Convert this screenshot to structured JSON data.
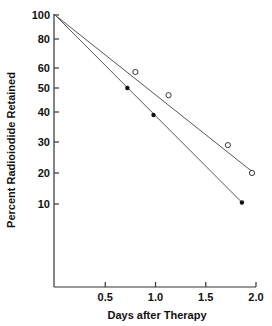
{
  "chart_data": {
    "type": "scatter",
    "title": "",
    "xlabel": "Days after Therapy",
    "ylabel": "Percent Radioiodide Retained",
    "xlim": [
      0,
      2.0
    ],
    "ylim": [
      0,
      100
    ],
    "x_ticks": [
      "0.5",
      "1.0",
      "1.5",
      "2.0"
    ],
    "y_ticks": [
      "100",
      "80",
      "60",
      "50",
      "40",
      "30",
      "20",
      "10"
    ],
    "grid": false,
    "legend": null,
    "series": [
      {
        "name": "open-circles",
        "marker": "open-circle",
        "x": [
          0.8,
          1.13,
          1.72,
          1.96
        ],
        "y": [
          58,
          47,
          29,
          20
        ],
        "fit_line": {
          "x": [
            0,
            1.96
          ],
          "y": [
            100,
            20.5
          ]
        }
      },
      {
        "name": "filled-circles",
        "marker": "filled-circle",
        "x": [
          0.72,
          0.98,
          1.86
        ],
        "y": [
          50,
          39,
          10.5
        ],
        "fit_line": {
          "x": [
            0,
            1.86
          ],
          "y": [
            100,
            10.5
          ]
        }
      }
    ]
  },
  "layout": {
    "x_origin_px": 55,
    "x_px_per_unit": 100.5,
    "x_axis_y_px": 287,
    "y_axis_x_px": 54,
    "y_tick_px": {
      "100": 15,
      "80": 39,
      "60": 68,
      "50": 88,
      "40": 112,
      "30": 142,
      "20": 173,
      "10": 204
    }
  }
}
